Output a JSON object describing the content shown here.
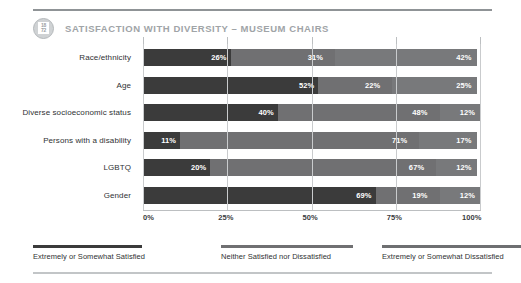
{
  "header": {
    "badge_icon": "report-badge-icon",
    "badge_top_text": "18",
    "badge_bottom_text": "72",
    "title": "SATISFACTION WITH DIVERSITY – MUSEUM CHAIRS"
  },
  "chart_data": {
    "type": "bar",
    "orientation": "horizontal",
    "stacked": true,
    "normalized_percent": true,
    "title": "SATISFACTION WITH DIVERSITY – MUSEUM CHAIRS",
    "xlabel": "",
    "ylabel": "",
    "xlim": [
      0,
      100
    ],
    "grid": true,
    "grid_axis": "x",
    "legend_position": "bottom",
    "xticks": [
      "0%",
      "25%",
      "50%",
      "75%",
      "100%"
    ],
    "xtick_values": [
      0,
      25,
      50,
      75,
      100
    ],
    "categories": [
      "Race/ethnicity",
      "Age",
      "Diverse socioeconomic status",
      "Persons with a disability",
      "LGBTQ",
      "Gender"
    ],
    "series": [
      {
        "name": "Extremely or Somewhat Satisfied",
        "color": "#3b3b3b",
        "values": [
          26,
          52,
          40,
          11,
          20,
          69
        ],
        "labels": [
          "26%",
          "52%",
          "40%",
          "11%",
          "20%",
          "69%"
        ]
      },
      {
        "name": "Neither Satisfied nor Dissatisfied",
        "color": "#707072",
        "values": [
          31,
          22,
          48,
          71,
          67,
          19
        ],
        "labels": [
          "31%",
          "22%",
          "48%",
          "71%",
          "67%",
          "19%"
        ]
      },
      {
        "name": "Extremely or Somewhat Dissatisfied",
        "color": "#78797b",
        "values": [
          42,
          25,
          12,
          17,
          12,
          12
        ],
        "labels": [
          "42%",
          "25%",
          "12%",
          "17%",
          "12%",
          "12%"
        ]
      }
    ]
  },
  "legend": [
    {
      "label": "Extremely or Somewhat Satisfied"
    },
    {
      "label": "Neither Satisfied nor Dissatisfied"
    },
    {
      "label": "Extremely or Somewhat Dissatisfied"
    }
  ]
}
